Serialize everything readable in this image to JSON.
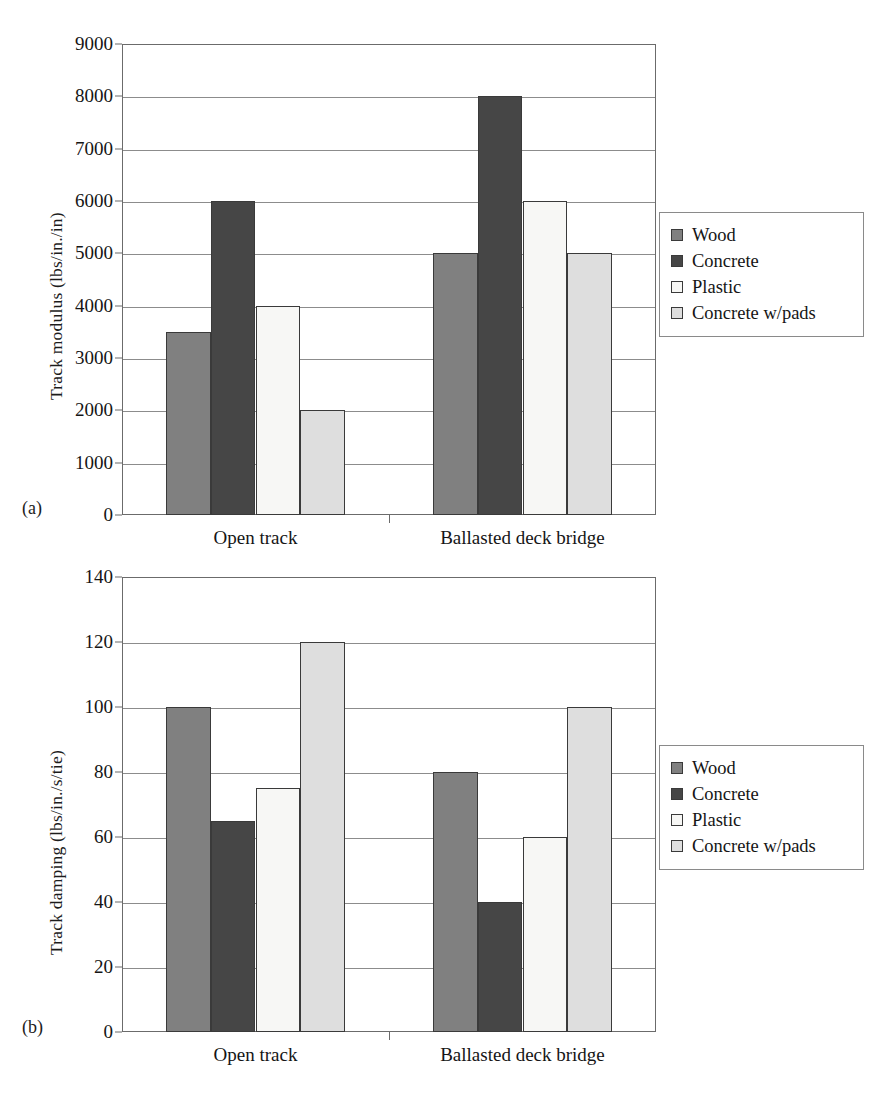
{
  "figure": {
    "panels": [
      {
        "tag": "(a)",
        "ylabel": "Track modulus (lbs/in./in)",
        "xcategories": [
          "Open track",
          "Ballasted deck bridge"
        ],
        "yticks": [
          "0",
          "1000",
          "2000",
          "3000",
          "4000",
          "5000",
          "6000",
          "7000",
          "8000",
          "9000"
        ]
      },
      {
        "tag": "(b)",
        "ylabel": "Track damping (lbs/in./s/tie)",
        "xcategories": [
          "Open track",
          "Ballasted deck bridge"
        ],
        "yticks": [
          "0",
          "20",
          "40",
          "60",
          "80",
          "100",
          "120",
          "140"
        ]
      }
    ],
    "legend": {
      "entries": [
        {
          "label": "Wood",
          "color": "#808080"
        },
        {
          "label": "Concrete",
          "color": "#464646"
        },
        {
          "label": "Plastic",
          "color": "#f7f7f5"
        },
        {
          "label": "Concrete w/pads",
          "color": "#dedede"
        }
      ]
    }
  },
  "chart_data": [
    {
      "type": "bar",
      "panel": "(a)",
      "title": "",
      "xlabel": "",
      "ylabel": "Track modulus (lbs/in./in)",
      "ylim": [
        0,
        9000
      ],
      "ytick_step": 1000,
      "yticks": [
        0,
        1000,
        2000,
        3000,
        4000,
        5000,
        6000,
        7000,
        8000,
        9000
      ],
      "grid": true,
      "legend_position": "right",
      "categories": [
        "Open track",
        "Ballasted deck bridge"
      ],
      "series": [
        {
          "name": "Wood",
          "color": "#808080",
          "values": [
            3500,
            5000
          ]
        },
        {
          "name": "Concrete",
          "color": "#464646",
          "values": [
            6000,
            8000
          ]
        },
        {
          "name": "Plastic",
          "color": "#f7f7f5",
          "values": [
            4000,
            6000
          ]
        },
        {
          "name": "Concrete w/pads",
          "color": "#dedede",
          "values": [
            2000,
            5000
          ]
        }
      ]
    },
    {
      "type": "bar",
      "panel": "(b)",
      "title": "",
      "xlabel": "",
      "ylabel": "Track damping (lbs/in./s/tie)",
      "ylim": [
        0,
        140
      ],
      "ytick_step": 20,
      "yticks": [
        0,
        20,
        40,
        60,
        80,
        100,
        120,
        140
      ],
      "grid": true,
      "legend_position": "right",
      "categories": [
        "Open track",
        "Ballasted deck bridge"
      ],
      "series": [
        {
          "name": "Wood",
          "color": "#808080",
          "values": [
            100,
            80
          ]
        },
        {
          "name": "Concrete",
          "color": "#464646",
          "values": [
            65,
            40
          ]
        },
        {
          "name": "Plastic",
          "color": "#f7f7f5",
          "values": [
            75,
            60
          ]
        },
        {
          "name": "Concrete w/pads",
          "color": "#dedede",
          "values": [
            120,
            100
          ]
        }
      ]
    }
  ]
}
